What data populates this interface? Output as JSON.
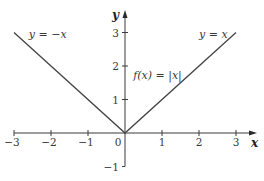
{
  "chart_data": {
    "type": "line",
    "title": "",
    "xlabel": "x",
    "ylabel": "y",
    "xlim": [
      -3,
      3
    ],
    "ylim": [
      -1,
      3
    ],
    "grid": false,
    "x_ticks": [
      -3,
      -2,
      -1,
      0,
      1,
      2,
      3
    ],
    "x_tick_labels": [
      "−3",
      "−2",
      "−1",
      "0",
      "1",
      "2",
      "3"
    ],
    "y_ticks": [
      -1,
      1,
      2,
      3
    ],
    "y_tick_labels": [
      "−1",
      "1",
      "2",
      "3"
    ],
    "series": [
      {
        "name": "f(x) = |x|",
        "x": [
          -3,
          0,
          3
        ],
        "y": [
          3,
          0,
          3
        ]
      }
    ],
    "annotations": [
      {
        "text": "y = −x",
        "x": -2.6,
        "y": 2.85
      },
      {
        "text": "y = x",
        "x": 2.0,
        "y": 2.85
      },
      {
        "text": "f(x) = |x|",
        "x": 0.22,
        "y": 1.6
      }
    ]
  }
}
